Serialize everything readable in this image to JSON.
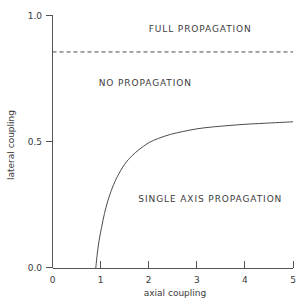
{
  "chart_data": {
    "type": "line",
    "title": "",
    "xlabel": "axial coupling",
    "ylabel": "lateral coupling",
    "xlim": [
      0,
      5
    ],
    "ylim": [
      0.0,
      1.0
    ],
    "xticks": [
      0,
      1,
      2,
      3,
      4,
      5
    ],
    "xticklabels": [
      "0",
      "1",
      "2",
      "3",
      "4",
      "5"
    ],
    "yticks": [
      0.0,
      0.5,
      1.0
    ],
    "yticklabels": [
      "0.0",
      "0.5",
      "1.0"
    ],
    "grid": false,
    "legend": "none",
    "series": [
      {
        "name": "single-axis / no propagation boundary",
        "style": "solid",
        "x": [
          0.9,
          0.93,
          0.97,
          1.02,
          1.08,
          1.15,
          1.25,
          1.35,
          1.5,
          1.65,
          1.8,
          2.0,
          2.2,
          2.45,
          2.7,
          3.0,
          3.3,
          3.6,
          4.0,
          4.4,
          5.0
        ],
        "y": [
          0.0,
          0.055,
          0.11,
          0.16,
          0.215,
          0.265,
          0.32,
          0.362,
          0.41,
          0.443,
          0.468,
          0.495,
          0.512,
          0.528,
          0.539,
          0.55,
          0.557,
          0.562,
          0.568,
          0.572,
          0.578
        ]
      },
      {
        "name": "full propagation threshold",
        "style": "dashed",
        "x": [
          0,
          5
        ],
        "y": [
          0.854,
          0.854
        ]
      }
    ],
    "annotations": [
      {
        "text": "FULL PROPAGATION",
        "x": 3.07,
        "y": 0.932
      },
      {
        "text": "NO PROPAGATION",
        "x": 1.93,
        "y": 0.719
      },
      {
        "text": "SINGLE AXIS PROPAGATION",
        "x": 3.28,
        "y": 0.261
      }
    ]
  },
  "axes": {
    "x_title": "axial coupling",
    "y_title": "lateral coupling",
    "x_tick_0": "0",
    "x_tick_1": "1",
    "x_tick_2": "2",
    "x_tick_3": "3",
    "x_tick_4": "4",
    "x_tick_5": "5",
    "y_tick_0": "0.0",
    "y_tick_1": "0.5",
    "y_tick_2": "1.0"
  },
  "regions": {
    "full": "FULL PROPAGATION",
    "none": "NO PROPAGATION",
    "single": "SINGLE AXIS PROPAGATION"
  }
}
